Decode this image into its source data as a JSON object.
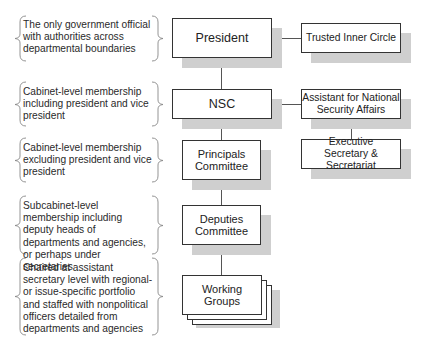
{
  "descriptions": [
    "The only government official with authorities across departmental boundaries",
    "Cabinet-level membership including president and vice president",
    "Cabinet-level membership excluding president and vice president",
    "Subcabinet-level membership including deputy heads of departments and agencies, or perhaps under secretaries",
    "Chaired at assistant secretary level with regional- or issue-specific portfolio and staffed with nonpolitical officers detailed from departments and agencies"
  ],
  "main_boxes": {
    "president": "President",
    "nsc": "NSC",
    "principals": "Principals Committee",
    "deputies": "Deputies Committee",
    "working_groups": "Working Groups"
  },
  "side_boxes": {
    "inner_circle": "Trusted Inner Circle",
    "assistant": "Assistant for National Security Affairs",
    "exec_secretary": "Executive Secretary & Secretariat"
  }
}
